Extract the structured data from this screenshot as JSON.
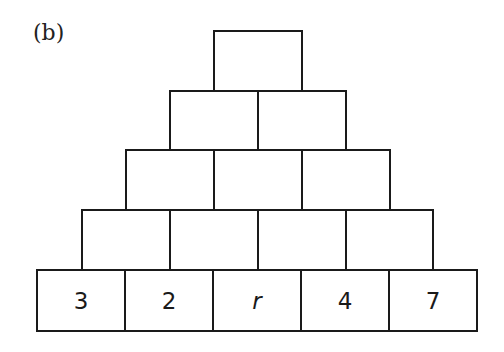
{
  "label": "(b)",
  "pyramid": {
    "rows": [
      {
        "cells": [
          "",
          "",
          "",
          "",
          ""
        ],
        "note": "bottom row",
        "values": [
          "3",
          "2",
          "r",
          "4",
          "7"
        ]
      },
      {
        "cells": [
          "",
          "",
          "",
          ""
        ]
      },
      {
        "cells": [
          "",
          "",
          ""
        ]
      },
      {
        "cells": [
          "",
          ""
        ]
      },
      {
        "cells": [
          ""
        ]
      }
    ],
    "bottom": [
      "3",
      "2",
      "r",
      "4",
      "7"
    ]
  }
}
